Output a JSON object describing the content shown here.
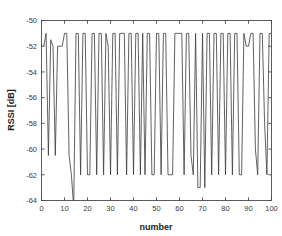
{
  "chart_data": {
    "type": "line",
    "title": "",
    "subtitle": "",
    "xlabel": "number",
    "ylabel": "RSSI [dB]",
    "xlim": [
      0,
      100
    ],
    "ylim": [
      -64,
      -50
    ],
    "xticks": [
      0,
      10,
      20,
      30,
      40,
      50,
      60,
      70,
      80,
      90,
      100
    ],
    "yticks": [
      -50,
      -52,
      -54,
      -56,
      -58,
      -60,
      -62,
      -64
    ],
    "xtick_labels": [
      "0",
      "10",
      "20",
      "30",
      "40",
      "50",
      "60",
      "70",
      "80",
      "90",
      "100"
    ],
    "ytick_labels": [
      "-50",
      "-52",
      "-54",
      "-56",
      "-58",
      "-60",
      "-62",
      "-64"
    ],
    "grid": false,
    "legend": null,
    "legend_position": "none",
    "line_color": "#3a3a3a",
    "axis_color": "#4a4a4a",
    "background_color": "#ffffff",
    "series": [
      {
        "name": "RSSI",
        "x": [
          1,
          2,
          3,
          4,
          5,
          6,
          7,
          8,
          9,
          10,
          11,
          12,
          13,
          14,
          15,
          16,
          17,
          18,
          19,
          20,
          21,
          22,
          23,
          24,
          25,
          26,
          27,
          28,
          29,
          30,
          31,
          32,
          33,
          34,
          35,
          36,
          37,
          38,
          39,
          40,
          41,
          42,
          43,
          44,
          45,
          46,
          47,
          48,
          49,
          50,
          51,
          52,
          53,
          54,
          55,
          56,
          57,
          58,
          59,
          60,
          61,
          62,
          63,
          64,
          65,
          66,
          67,
          68,
          69,
          70,
          71,
          72,
          73,
          74,
          75,
          76,
          77,
          78,
          79,
          80,
          81,
          82,
          83,
          84,
          85,
          86,
          87,
          88,
          89,
          90,
          91,
          92,
          93,
          94,
          95,
          96,
          97,
          98,
          99,
          100
        ],
        "values": [
          -52,
          -51,
          -60.5,
          -51.5,
          -52,
          -60.5,
          -52,
          -52,
          -52,
          -51,
          -51,
          -60.5,
          -62,
          -64.5,
          -51,
          -51,
          -62,
          -51,
          -51,
          -62,
          -62,
          -51,
          -51,
          -62,
          -51,
          -51,
          -62,
          -51,
          -52,
          -62,
          -51,
          -51,
          -62,
          -51,
          -51,
          -51,
          -62,
          -51,
          -51,
          -62,
          -51,
          -51,
          -62,
          -51,
          -62,
          -51,
          -51,
          -62,
          -62,
          -51,
          -51,
          -62,
          -51,
          -51,
          -62,
          -62,
          -62,
          -51,
          -51,
          -51,
          -51,
          -62,
          -51,
          -51,
          -60.5,
          -62,
          -51,
          -63,
          -63,
          -51,
          -63,
          -51,
          -51,
          -62,
          -51,
          -51,
          -62,
          -51,
          -51,
          -62,
          -51,
          -51,
          -62,
          -51,
          -51,
          -62,
          -62,
          -51,
          -52,
          -52,
          -51,
          -51,
          -60,
          -62,
          -51,
          -51,
          -58,
          -62,
          -51,
          -51
        ]
      }
    ]
  }
}
